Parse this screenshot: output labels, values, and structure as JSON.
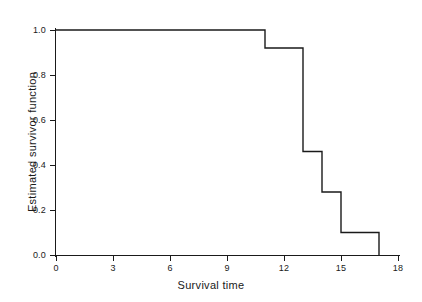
{
  "chart_data": {
    "type": "line",
    "subtype": "step-post",
    "title": "",
    "xlabel": "Survival time",
    "ylabel": "Estimated survivor function",
    "xlim": [
      0,
      18
    ],
    "ylim": [
      0.0,
      1.0
    ],
    "grid": false,
    "legend": false,
    "line_color": "#1a1a1a",
    "background_color": "#ffffff",
    "xticks": [
      0,
      3,
      6,
      9,
      12,
      15,
      18
    ],
    "xtick_labels": [
      "0",
      "3",
      "6",
      "9",
      "12",
      "15",
      "18"
    ],
    "yticks": [
      0.0,
      0.2,
      0.4,
      0.6,
      0.8,
      1.0
    ],
    "ytick_labels": [
      "0.0",
      "0.2",
      "0.4",
      "0.6",
      "0.8",
      "1.0"
    ],
    "x": [
      0,
      11,
      13,
      14,
      15,
      17
    ],
    "y": [
      1.0,
      0.92,
      0.46,
      0.28,
      0.1,
      0.0
    ],
    "steps": [
      {
        "time": 0,
        "survival": 1.0
      },
      {
        "time": 11,
        "survival": 0.92
      },
      {
        "time": 13,
        "survival": 0.46
      },
      {
        "time": 14,
        "survival": 0.28
      },
      {
        "time": 15,
        "survival": 0.1
      },
      {
        "time": 17,
        "survival": 0.0
      }
    ],
    "series": [
      {
        "name": "Estimated survivor function",
        "x": [
          0,
          11,
          13,
          14,
          15,
          17
        ],
        "values": [
          1.0,
          0.92,
          0.46,
          0.28,
          0.1,
          0.0
        ]
      }
    ]
  }
}
